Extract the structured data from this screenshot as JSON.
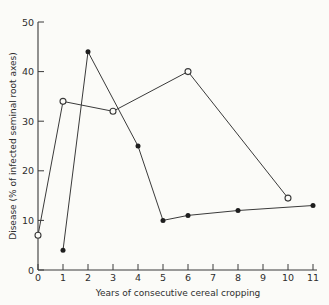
{
  "figure": {
    "background": "#fbfbf8",
    "line_color": "#3a3a3a",
    "marker_fill": "#1e1e1e",
    "text_color": "#2e2e2e"
  },
  "chart_data": {
    "type": "line",
    "title": "",
    "xlabel": "Years of consecutive cereal cropping",
    "ylabel": "Disease (% of infected seminal root axes)",
    "xlim": [
      0,
      11
    ],
    "ylim": [
      0,
      50
    ],
    "x_ticks": [
      0,
      1,
      2,
      3,
      4,
      5,
      6,
      7,
      8,
      9,
      10,
      11
    ],
    "y_ticks": [
      0,
      10,
      20,
      30,
      40,
      50
    ],
    "grid": false,
    "legend_position": "none",
    "series": [
      {
        "name": "open-circle-series",
        "marker": "open-circle",
        "points": [
          [
            0,
            7
          ],
          [
            1,
            34
          ],
          [
            3,
            32
          ],
          [
            6,
            40
          ],
          [
            10,
            14.5
          ]
        ]
      },
      {
        "name": "filled-circle-series",
        "marker": "filled-circle",
        "points": [
          [
            1,
            4
          ],
          [
            2,
            44
          ],
          [
            4,
            25
          ],
          [
            5,
            10
          ],
          [
            6,
            11
          ],
          [
            8,
            12
          ],
          [
            11,
            13
          ]
        ]
      }
    ]
  }
}
